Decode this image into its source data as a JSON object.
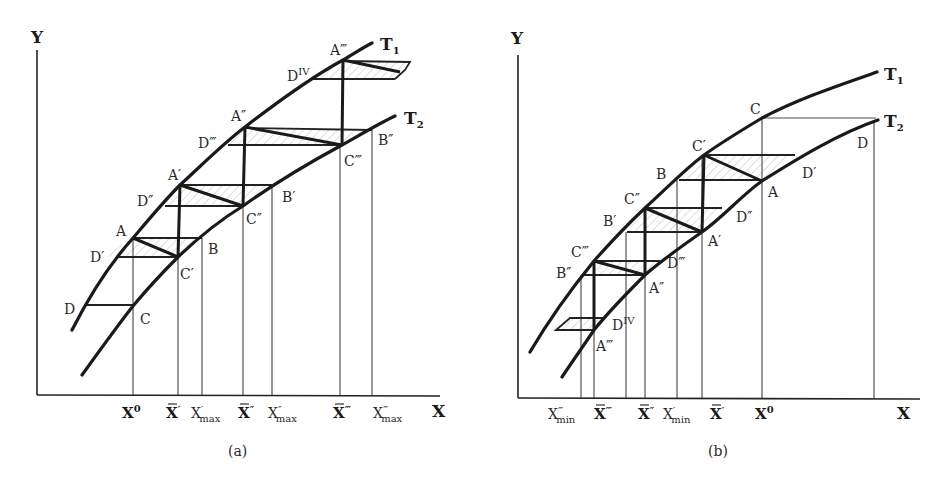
{
  "figure": {
    "panels": [
      {
        "id": "a",
        "caption": "(a)",
        "y_axis_label": "Y",
        "x_axis_label": "X",
        "curves": [
          {
            "name": "T",
            "sub": "1"
          },
          {
            "name": "T",
            "sub": "2"
          }
        ],
        "x_ticks": [
          {
            "base": "X",
            "sup": "0",
            "sub": "",
            "bar": false
          },
          {
            "base": "X",
            "sup": "′",
            "sub": "",
            "bar": true
          },
          {
            "base": "X",
            "sup": "′",
            "sub": "max",
            "bar": false
          },
          {
            "base": "X",
            "sup": "″",
            "sub": "",
            "bar": true
          },
          {
            "base": "X",
            "sup": "″",
            "sub": "max",
            "bar": false
          },
          {
            "base": "X",
            "sup": "‴",
            "sub": "",
            "bar": true
          },
          {
            "base": "X",
            "sup": "‴",
            "sub": "max",
            "bar": false
          }
        ],
        "points": {
          "A": "A",
          "A1": "A′",
          "A2": "A″",
          "A3": "A‴",
          "B": "B",
          "B1": "B′",
          "B2": "B″",
          "C": "C",
          "C1": "C′",
          "C2": "C″",
          "C3": "C‴",
          "D": "D",
          "D1": "D′",
          "D2": "D″",
          "D3": "D‴",
          "D4": "D",
          "D4_sup": "IV"
        }
      },
      {
        "id": "b",
        "caption": "(b)",
        "y_axis_label": "Y",
        "x_axis_label": "X",
        "curves": [
          {
            "name": "T",
            "sub": "1"
          },
          {
            "name": "T",
            "sub": "2"
          }
        ],
        "x_ticks": [
          {
            "base": "X",
            "sup": "‴",
            "sub": "min",
            "bar": false
          },
          {
            "base": "X",
            "sup": "‴",
            "sub": "",
            "bar": true
          },
          {
            "base": "X",
            "sup": "″",
            "sub": "",
            "bar": true
          },
          {
            "base": "X",
            "sup": "′",
            "sub": "min",
            "bar": false
          },
          {
            "base": "X",
            "sup": "′",
            "sub": "",
            "bar": true
          },
          {
            "base": "X",
            "sup": "0",
            "sub": "",
            "bar": false
          }
        ],
        "points": {
          "A": "A",
          "A1": "A′",
          "A2": "A″",
          "A3": "A‴",
          "B": "B",
          "B1": "B′",
          "B2": "B″",
          "C": "C",
          "C1": "C′",
          "C2": "C″",
          "C3": "C‴",
          "D": "D",
          "D1": "D′",
          "D2": "D″",
          "D3": "D‴",
          "D4": "D",
          "D4_sup": "IV"
        }
      }
    ]
  }
}
